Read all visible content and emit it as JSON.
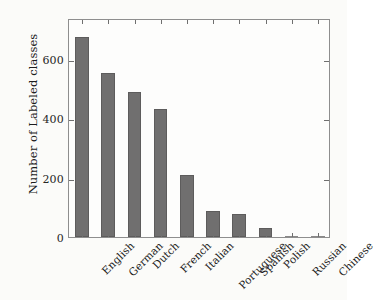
{
  "chart_data": {
    "type": "bar",
    "title": "",
    "subtitle": "",
    "xlabel": "",
    "ylabel": "Number of Labeled classes",
    "categories": [
      "English",
      "German",
      "Dutch",
      "French",
      "Italian",
      "Portuguese",
      "Spanish",
      "Polish",
      "Russian",
      "Chinese"
    ],
    "values": [
      674,
      553,
      489,
      430,
      208,
      88,
      78,
      30,
      5,
      1
    ],
    "series": [
      {
        "name": "Number of Labeled classes",
        "values": [
          674,
          553,
          489,
          430,
          208,
          88,
          78,
          30,
          5,
          1
        ]
      }
    ],
    "ylim": [
      0,
      738
    ],
    "yticks": [
      0,
      200,
      400,
      600
    ],
    "ytick_labels": [
      "0",
      "200",
      "400",
      "600"
    ],
    "xtick_rotation": -45,
    "grid": false,
    "legend": false,
    "legend_position": "none",
    "bar_color": "#706f6f",
    "bar_edge_color": "#5d5c5c",
    "frame_color": "#8e8e8e",
    "background_color": "#fbfbf9"
  }
}
